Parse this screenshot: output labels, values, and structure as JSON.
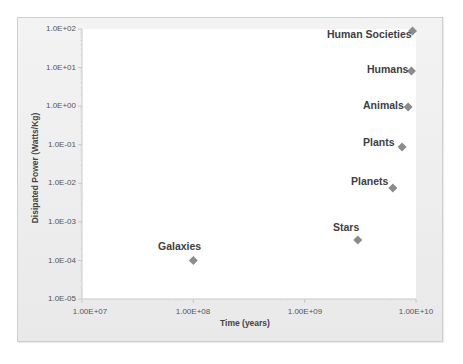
{
  "chart_data": {
    "type": "scatter",
    "title": "",
    "xlabel": "Time (years)",
    "ylabel": "Disipated Power (Watts/Kg)",
    "xscale": "log",
    "yscale": "log",
    "xlim": [
      10000000,
      10000000000
    ],
    "ylim": [
      1e-05,
      100
    ],
    "x_ticks": [
      "1.00E+07",
      "1.00E+08",
      "1.00E+09",
      "1.00E+10"
    ],
    "y_ticks": [
      "1.0E+02",
      "1.0E+01",
      "1.0E+00",
      "1.0E-01",
      "1.0E-02",
      "1.0E-03",
      "1.0E-04",
      "1.0E-05"
    ],
    "grid": false,
    "legend": null,
    "marker": "diamond",
    "marker_color": "#8c8c8c",
    "points": [
      {
        "label": "Galaxies",
        "x": 100000000,
        "y": 0.0001
      },
      {
        "label": "Stars",
        "x": 3000000000,
        "y": 0.00034
      },
      {
        "label": "Planets",
        "x": 6200000000,
        "y": 0.0076
      },
      {
        "label": "Plants",
        "x": 7500000000,
        "y": 0.087
      },
      {
        "label": "Animals",
        "x": 8500000000,
        "y": 0.95
      },
      {
        "label": "Humans",
        "x": 9100000000,
        "y": 8.2
      },
      {
        "label": "Human Societies",
        "x": 9300000000,
        "y": 89
      }
    ]
  },
  "axes": {
    "x_title": "Time (years)",
    "y_title": "Disipated Power (Watts/Kg)",
    "x_ticks": [
      "1.00E+07",
      "1.00E+08",
      "1.00E+09",
      "1.00E+10"
    ],
    "y_ticks": [
      "1.0E+02",
      "1.0E+01",
      "1.0E+00",
      "1.0E-01",
      "1.0E-02",
      "1.0E-03",
      "1.0E-04",
      "1.0E-05"
    ]
  },
  "labels": {
    "galaxies": "Galaxies",
    "stars": "Stars",
    "planets": "Planets",
    "plants": "Plants",
    "animals": "Animals",
    "humans": "Humans",
    "human_societies": "Human Societies"
  }
}
